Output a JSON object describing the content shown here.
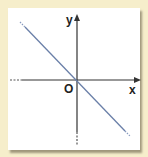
{
  "diagram": {
    "type": "coordinate-plane",
    "labels": {
      "y_axis": "y",
      "origin": "O",
      "x_axis": "x"
    },
    "line": {
      "description": "straight line through origin with negative slope",
      "color": "#6a7fa8"
    },
    "colors": {
      "background": "#f6eecb",
      "panel": "#ffffff",
      "axis": "#333333"
    }
  }
}
